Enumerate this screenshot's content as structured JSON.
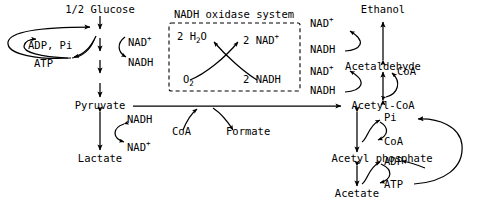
{
  "diagram": {
    "canvas": {
      "width": 477,
      "height": 210
    },
    "stroke_color": "#000000",
    "background_color": "#ffffff"
  },
  "box": {
    "label": "NADH oxidase system",
    "border_style": "dashed",
    "nodes": {
      "water": "2 H",
      "water_sub": "2",
      "water_tail": "O",
      "oxygen": "O",
      "oxygen_sub": "2",
      "nad_plus": "2 NAD",
      "nad_plus_sup": "+",
      "nadh": "2 NADH"
    }
  },
  "metabolites": {
    "glucose": "1/2 Glucose",
    "pyruvate": "Pyruvate",
    "lactate": "Lactate",
    "formate": "Formate",
    "acetyl_coa": "Acetyl-CoA",
    "acetaldehyde": "Acetaldehyde",
    "ethanol": "Ethanol",
    "acetyl_phosphate": "Acetyl phosphate",
    "acetate": "Acetate"
  },
  "cofactors": {
    "adp_pi": "ADP, Pi",
    "atp_left": "ATP",
    "nad_plus_glyc": "NAD",
    "nadh_glyc": "NADH",
    "nadh_lac": "NADH",
    "nad_plus_lac": "NAD",
    "coa_pyruvate": "CoA",
    "nad_plus_eth": "NAD",
    "nadh_eth": "NADH",
    "nad_plus_ald": "NAD",
    "nadh_ald": "NADH",
    "coa_ald": "CoA",
    "pi_right": "Pi",
    "coa_right": "CoA",
    "adp_right": "ADP",
    "atp_right": "ATP",
    "plus_sign": "+"
  }
}
